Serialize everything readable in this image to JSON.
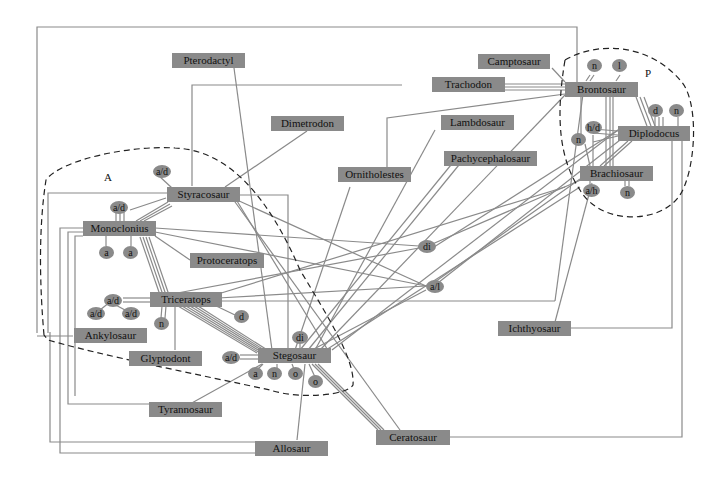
{
  "diagram": {
    "regions": [
      {
        "id": "A",
        "label": "A"
      },
      {
        "id": "P",
        "label": "P"
      }
    ],
    "nodes": [
      {
        "id": "pterodactyl",
        "label": "Pterodactyl"
      },
      {
        "id": "camptosaur",
        "label": "Camptosaur"
      },
      {
        "id": "trachodon",
        "label": "Trachodon"
      },
      {
        "id": "brontosaur",
        "label": "Brontosaur"
      },
      {
        "id": "dimetrodon",
        "label": "Dimetrodon"
      },
      {
        "id": "lambdosaur",
        "label": "Lambdosaur"
      },
      {
        "id": "diplodocus",
        "label": "Diplodocus"
      },
      {
        "id": "ornitholestes",
        "label": "Ornitholestes"
      },
      {
        "id": "pachycephalosaur",
        "label": "Pachycephalosaur"
      },
      {
        "id": "brachiosaur",
        "label": "Brachiosaur"
      },
      {
        "id": "styracosaur",
        "label": "Styracosaur"
      },
      {
        "id": "monoclonius",
        "label": "Monoclonius"
      },
      {
        "id": "protoceratops",
        "label": "Protoceratops"
      },
      {
        "id": "triceratops",
        "label": "Triceratops"
      },
      {
        "id": "ankylosaur",
        "label": "Ankylosaur"
      },
      {
        "id": "glyptodont",
        "label": "Glyptodont"
      },
      {
        "id": "stegosaur",
        "label": "Stegosaur"
      },
      {
        "id": "ichthyosaur",
        "label": "Ichthyosaur"
      },
      {
        "id": "tyrannosaur",
        "label": "Tyrannosaur"
      },
      {
        "id": "ceratosaur",
        "label": "Ceratosaur"
      },
      {
        "id": "allosaur",
        "label": "Allosaur"
      }
    ],
    "tags": [
      {
        "label": "a/d"
      },
      {
        "label": "a/d"
      },
      {
        "label": "a"
      },
      {
        "label": "a"
      },
      {
        "label": "a/d"
      },
      {
        "label": "a/d"
      },
      {
        "label": "a/d"
      },
      {
        "label": "n"
      },
      {
        "label": "d"
      },
      {
        "label": "di"
      },
      {
        "label": "a/d"
      },
      {
        "label": "a"
      },
      {
        "label": "n"
      },
      {
        "label": "o"
      },
      {
        "label": "o"
      },
      {
        "label": "di"
      },
      {
        "label": "a/l"
      },
      {
        "label": "n"
      },
      {
        "label": "l"
      },
      {
        "label": "d"
      },
      {
        "label": "n"
      },
      {
        "label": "h/d"
      },
      {
        "label": "n"
      },
      {
        "label": "a/h"
      },
      {
        "label": "n"
      }
    ]
  }
}
